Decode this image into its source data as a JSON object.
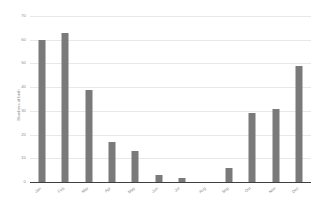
{
  "chart_data": {
    "type": "bar",
    "title": "",
    "subtitle": "",
    "xlabel": "",
    "ylabel": "Numbers of birth",
    "categories": [
      "Jan",
      "Feb",
      "Mar",
      "Apr",
      "May",
      "Jun",
      "Jul",
      "Aug",
      "Sep",
      "Oct",
      "Nov",
      "Dec"
    ],
    "values": [
      60,
      63,
      39,
      17,
      13,
      3,
      1.5,
      0,
      6,
      29,
      31,
      49
    ],
    "ylim": [
      0,
      70
    ],
    "ytick_labels": [
      "70",
      "60",
      "50",
      "40",
      "30",
      "20",
      "10",
      "0"
    ],
    "ytick_values": [
      70,
      60,
      50,
      40,
      30,
      20,
      10,
      0
    ],
    "grid": true,
    "legend": false,
    "legend_position": "none",
    "bar_color": "#7a7a7a",
    "grid_color": "#e8e8e8",
    "axis_color": "#3f3f3f",
    "text_color": "#8d8d8d",
    "background_color": "#ffffff"
  }
}
